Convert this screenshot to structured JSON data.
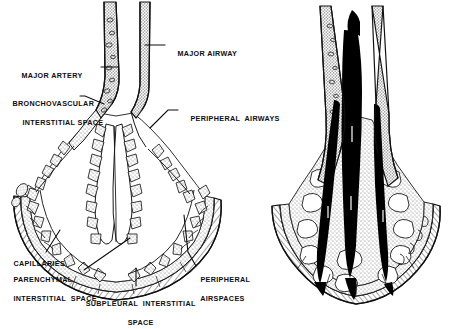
{
  "figure": {
    "background_color": "#ffffff",
    "ink_color": "#0d0d0d",
    "stipple_color": "#8c8c8c",
    "fill_black": "#000000",
    "panels": [
      {
        "id": "left-panel",
        "name": "normal-lung-diagram",
        "description": "Line drawing of a lung segment showing major airway, major artery, bronchovascular interstitial space, peripheral airways, peripheral airspaces, capillaries, parenchymal interstitial space and subpleural interstitial space."
      },
      {
        "id": "right-panel",
        "name": "fluid-filled-lung-diagram",
        "description": "Same lung segment with the bronchovascular and peripheral airspaces filled solid black indicating fluid accumulation."
      }
    ],
    "labels": [
      {
        "id": "major-artery",
        "text": "MAJOR ARTERY",
        "lines": [
          "MAJOR ARTERY"
        ]
      },
      {
        "id": "major-airway",
        "text": "MAJOR AIRWAY",
        "lines": [
          "MAJOR AIRWAY"
        ]
      },
      {
        "id": "bronchovascular-space",
        "text": "BRONCHOVASCULAR INTERSTITIAL SPACE",
        "lines": [
          "BRONCHOVASCULAR",
          "INTERSTITIAL SPACE"
        ]
      },
      {
        "id": "peripheral-airways",
        "text": "PERIPHERAL AIRWAYS",
        "lines": [
          "PERIPHERAL  AIRWAYS"
        ]
      },
      {
        "id": "capillaries",
        "text": "CAPILLARIES",
        "lines": [
          "CAPILLARIES"
        ]
      },
      {
        "id": "parenchymal-space",
        "text": "PARENCHYMAL INTERSTITIAL SPACE",
        "lines": [
          "PARENCHYMAL",
          "INTERSTITIAL  SPACE"
        ]
      },
      {
        "id": "subpleural-space",
        "text": "SUBPLEURAL INTERSTITIAL SPACE",
        "lines": [
          "SUBPLEURAL  INTERSTITIAL",
          "SPACE"
        ]
      },
      {
        "id": "peripheral-airspaces",
        "text": "PERIPHERAL AIRSPACES",
        "lines": [
          "PERIPHERAL",
          "AIRSPACES"
        ]
      }
    ]
  }
}
